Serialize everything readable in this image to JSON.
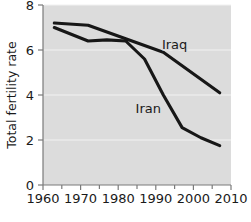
{
  "chart_data": {
    "type": "line",
    "title": "",
    "subtitle": "",
    "xlabel": "",
    "ylabel": "Total fertility rate",
    "xlim": [
      1960,
      2010
    ],
    "ylim": [
      0,
      8
    ],
    "grid": true,
    "legend_position": "inline-annotations",
    "xticks": [
      1960,
      1970,
      1980,
      1990,
      2000,
      2010
    ],
    "xtick_labels": [
      "1960",
      "1970",
      "1980",
      "1990",
      "2000",
      "2010"
    ],
    "xminor_ticks": [
      1965,
      1975,
      1985,
      1995,
      2005
    ],
    "yticks": [
      0,
      2,
      4,
      6,
      8
    ],
    "ytick_labels": [
      "0",
      "2",
      "4",
      "6",
      "8"
    ],
    "series": [
      {
        "name": "Iraq",
        "color": "#171717",
        "annotation": "Iraq",
        "annotation_x": 1995,
        "annotation_y": 6.05,
        "x": [
          1963,
          1972,
          1982,
          1987,
          1992,
          1997,
          2002,
          2007
        ],
        "values": [
          7.2,
          7.1,
          6.5,
          6.2,
          5.9,
          5.3,
          4.7,
          4.1
        ]
      },
      {
        "name": "Iran",
        "color": "#171717",
        "annotation": "Iran",
        "annotation_x": 1988,
        "annotation_y": 3.2,
        "x": [
          1963,
          1972,
          1977,
          1982,
          1987,
          1992,
          1997,
          2002,
          2007
        ],
        "values": [
          7.0,
          6.4,
          6.45,
          6.4,
          5.6,
          4.0,
          2.55,
          2.1,
          1.75
        ]
      }
    ]
  }
}
